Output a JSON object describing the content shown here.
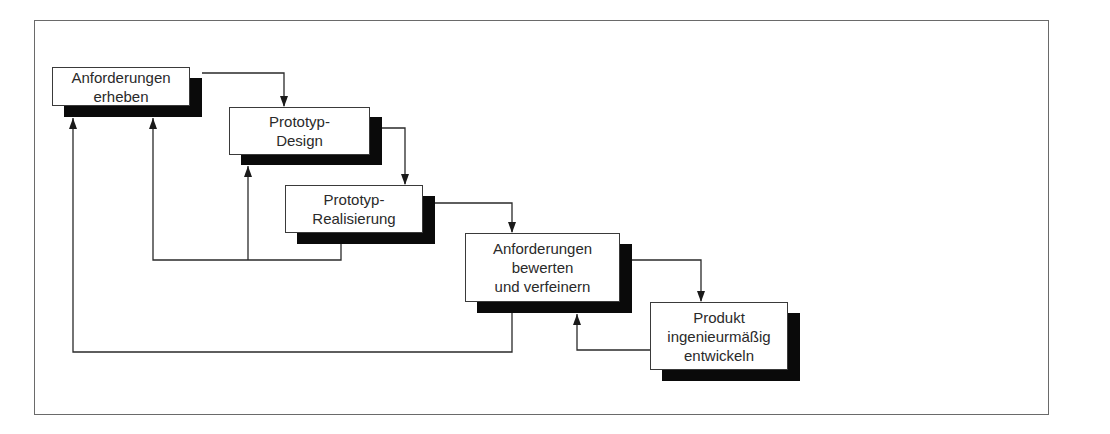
{
  "diagram": {
    "type": "flowchart",
    "title": "",
    "nodes": [
      {
        "id": "n1",
        "lines": [
          "Anforderungen",
          "erheben"
        ],
        "x": 52,
        "y": 67,
        "w": 138,
        "h": 38
      },
      {
        "id": "n2",
        "lines": [
          "Prototyp-",
          "Design"
        ],
        "x": 229,
        "y": 107,
        "w": 141,
        "h": 48
      },
      {
        "id": "n3",
        "lines": [
          "Prototyp-",
          "Realisierung"
        ],
        "x": 285,
        "y": 185,
        "w": 138,
        "h": 47
      },
      {
        "id": "n4",
        "lines": [
          "Anforderungen",
          "bewerten",
          "und verfeinern"
        ],
        "x": 465,
        "y": 233,
        "w": 155,
        "h": 69
      },
      {
        "id": "n5",
        "lines": [
          "Produkt",
          "ingenieurmäßig",
          "entwickeln"
        ],
        "x": 650,
        "y": 302,
        "w": 138,
        "h": 68
      }
    ],
    "shadow_offset": {
      "dx": 12,
      "dy": 11
    },
    "edges": [
      {
        "from": "n1",
        "to": "n2",
        "kind": "forward"
      },
      {
        "from": "n2",
        "to": "n3",
        "kind": "forward"
      },
      {
        "from": "n3",
        "to": "n4",
        "kind": "forward"
      },
      {
        "from": "n4",
        "to": "n5",
        "kind": "forward"
      },
      {
        "from": "n3",
        "to": "n1",
        "kind": "feedback"
      },
      {
        "from": "n3",
        "to": "n2",
        "kind": "feedback"
      },
      {
        "from": "n4",
        "to": "n1",
        "kind": "feedback"
      },
      {
        "from": "n5",
        "to": "n4",
        "kind": "feedback"
      }
    ],
    "colors": {
      "line": "#2a2a2a",
      "shadow": "#0a0a0a",
      "frame": "#6a6a6a",
      "background": "#ffffff"
    }
  }
}
